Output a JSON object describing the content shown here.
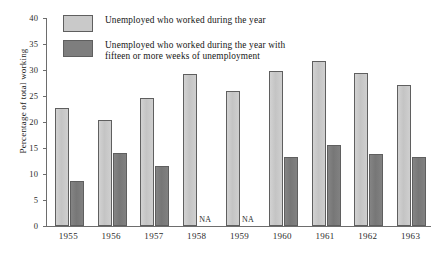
{
  "chart_data": {
    "type": "bar",
    "title": "",
    "subtitle": "",
    "xlabel": "",
    "ylabel": "Percentage of total working",
    "ylim": [
      0,
      40
    ],
    "y_ticks": [
      0,
      5,
      10,
      15,
      20,
      25,
      30,
      35,
      40
    ],
    "y_tick_labels": [
      "0",
      "5",
      "10",
      "15",
      "20",
      "25",
      "30",
      "35",
      "40"
    ],
    "grid": false,
    "legend_position": "top-left",
    "categories": [
      "1955",
      "1956",
      "1957",
      "1958",
      "1959",
      "1960",
      "1961",
      "1962",
      "1963"
    ],
    "series": [
      {
        "name": "Unemployed who worked during the year",
        "color": "#c9c9c9",
        "values": [
          22.6,
          20.4,
          24.6,
          29.2,
          26.0,
          29.9,
          31.7,
          29.5,
          27.1
        ]
      },
      {
        "name": "Unemployed who worked during the year with fifteen or more weeks of unemployment",
        "color": "#7e7e7e",
        "values": [
          8.6,
          14.1,
          11.6,
          null,
          null,
          13.3,
          15.6,
          13.9,
          13.2
        ]
      }
    ],
    "annotations": [
      {
        "category": "1958",
        "text": "NA"
      },
      {
        "category": "1959",
        "text": "NA"
      }
    ],
    "missing_value_label": "NA"
  },
  "legend": {
    "items": [
      {
        "swatch": "light",
        "label": "Unemployed who worked during the year"
      },
      {
        "swatch": "dark",
        "label": "Unemployed who worked during the year with\nfifteen or more weeks of unemployment"
      }
    ]
  },
  "axis": {
    "y_title": "Percentage of total working"
  }
}
